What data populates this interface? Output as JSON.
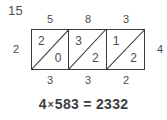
{
  "problem": {
    "number": "15"
  },
  "lattice": {
    "top_labels": [
      "5",
      "8",
      "3"
    ],
    "bottom_labels": [
      "3",
      "3",
      "2"
    ],
    "left_label": "2",
    "right_label": "4",
    "cells": [
      {
        "upper": "2",
        "lower": "0"
      },
      {
        "upper": "3",
        "lower": "2"
      },
      {
        "upper": "1",
        "lower": "2"
      }
    ]
  },
  "equation": {
    "multiplier": "4",
    "times_symbol": "×",
    "multiplicand": "583",
    "equals_symbol": "=",
    "product": "2332",
    "full_text": "4 × 583 = 2332"
  },
  "colors": {
    "ink": "#4d4d4d",
    "line": "#3a3a3a",
    "equation_ink": "#3d3d3d",
    "background": "#ffffff"
  }
}
